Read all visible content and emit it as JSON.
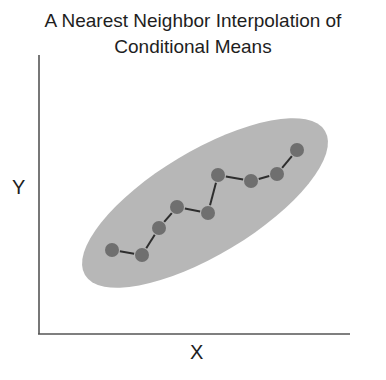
{
  "title": {
    "line1": "A Nearest Neighbor Interpolation of",
    "line2": "Conditional Means"
  },
  "axes": {
    "xlabel": "X",
    "ylabel": "Y"
  },
  "colors": {
    "ellipse_fill": "#b7b7b7",
    "point_fill": "#6f6f6f",
    "connector": "#2e2e2e",
    "axis": "#555555"
  },
  "ellipse": {
    "cx": 205,
    "cy": 203,
    "rx": 140,
    "ry": 52,
    "rotation_deg": -31
  },
  "points": [
    {
      "x": 112,
      "y": 250
    },
    {
      "x": 142,
      "y": 255
    },
    {
      "x": 159,
      "y": 228
    },
    {
      "x": 177,
      "y": 207
    },
    {
      "x": 208,
      "y": 213
    },
    {
      "x": 218,
      "y": 175
    },
    {
      "x": 251,
      "y": 181
    },
    {
      "x": 277,
      "y": 174
    },
    {
      "x": 297,
      "y": 150
    }
  ]
}
